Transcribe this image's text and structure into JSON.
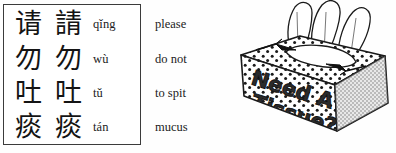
{
  "vocabulary": {
    "columns": [
      "simplified",
      "traditional",
      "pinyin",
      "english"
    ],
    "rows": [
      {
        "simplified": "请",
        "traditional": "請",
        "pinyin": "qǐng",
        "english": "please"
      },
      {
        "simplified": "勿",
        "traditional": "勿",
        "pinyin": "wù",
        "english": "do not"
      },
      {
        "simplified": "吐",
        "traditional": "吐",
        "pinyin": "tǔ",
        "english": "to spit"
      },
      {
        "simplified": "痰",
        "traditional": "痰",
        "pinyin": "tán",
        "english": "mucus"
      }
    ]
  },
  "illustration": {
    "name": "tissue-box-drawing",
    "box_text_line1": "Need A",
    "box_text_line2": "Tissue?",
    "ink_color": "#1a1a1a",
    "paper_color": "#ffffff",
    "shade_color": "#8c8c8c"
  }
}
